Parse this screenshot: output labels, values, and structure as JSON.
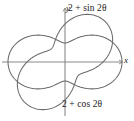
{
  "figure": {
    "type": "polar-curve-plot",
    "background_color": "#ffffff",
    "curve_color": "#6b6b6b",
    "axis_color": "#8a8a8a",
    "text_color": "#1a1a1a",
    "axes": {
      "x_axis_label": "x",
      "y_axis_label": "y",
      "origin_px": [
        65,
        62
      ]
    },
    "labels": {
      "sin_curve": "2 + sin 2θ",
      "cos_curve": "2 + cos 2θ"
    }
  },
  "chart_data": {
    "type": "line",
    "subtype": "polar",
    "title": "",
    "xlabel": "x",
    "ylabel": "y",
    "grid": false,
    "legend_position": "annotations-on-plot",
    "xlim": [
      -3.2,
      3.2
    ],
    "ylim": [
      -3.2,
      3.2
    ],
    "annotations": [
      {
        "text": "2 + sin 2θ",
        "target_series": "r = 2 + sin 2θ",
        "position_px": [
          68,
          4
        ]
      },
      {
        "text": "2 + cos 2θ",
        "target_series": "r = 2 + cos 2θ",
        "position_px": [
          62,
          100
        ]
      }
    ],
    "series": [
      {
        "name": "r = 2 + sin 2θ",
        "equation": "r = 2 + sin(2θ)",
        "r_min": 1,
        "r_max": 3,
        "petal_directions_deg": [
          45,
          135,
          225,
          315
        ],
        "values": [
          {
            "theta_deg": 0,
            "r": 2.0
          },
          {
            "theta_deg": 15,
            "r": 2.5
          },
          {
            "theta_deg": 30,
            "r": 2.866
          },
          {
            "theta_deg": 45,
            "r": 3.0
          },
          {
            "theta_deg": 60,
            "r": 2.866
          },
          {
            "theta_deg": 75,
            "r": 2.5
          },
          {
            "theta_deg": 90,
            "r": 2.0
          },
          {
            "theta_deg": 105,
            "r": 1.5
          },
          {
            "theta_deg": 120,
            "r": 1.134
          },
          {
            "theta_deg": 135,
            "r": 1.0
          },
          {
            "theta_deg": 150,
            "r": 1.134
          },
          {
            "theta_deg": 165,
            "r": 1.5
          },
          {
            "theta_deg": 180,
            "r": 2.0
          },
          {
            "theta_deg": 195,
            "r": 2.5
          },
          {
            "theta_deg": 210,
            "r": 2.866
          },
          {
            "theta_deg": 225,
            "r": 3.0
          },
          {
            "theta_deg": 240,
            "r": 2.866
          },
          {
            "theta_deg": 255,
            "r": 2.5
          },
          {
            "theta_deg": 270,
            "r": 2.0
          },
          {
            "theta_deg": 285,
            "r": 1.5
          },
          {
            "theta_deg": 300,
            "r": 1.134
          },
          {
            "theta_deg": 315,
            "r": 1.0
          },
          {
            "theta_deg": 330,
            "r": 1.134
          },
          {
            "theta_deg": 345,
            "r": 1.5
          },
          {
            "theta_deg": 360,
            "r": 2.0
          }
        ]
      },
      {
        "name": "r = 2 + cos 2θ",
        "equation": "r = 2 + cos(2θ)",
        "r_min": 1,
        "r_max": 3,
        "petal_directions_deg": [
          0,
          90,
          180,
          270
        ],
        "values": [
          {
            "theta_deg": 0,
            "r": 3.0
          },
          {
            "theta_deg": 15,
            "r": 2.866
          },
          {
            "theta_deg": 30,
            "r": 2.5
          },
          {
            "theta_deg": 45,
            "r": 2.0
          },
          {
            "theta_deg": 60,
            "r": 1.5
          },
          {
            "theta_deg": 75,
            "r": 1.134
          },
          {
            "theta_deg": 90,
            "r": 1.0
          },
          {
            "theta_deg": 105,
            "r": 1.134
          },
          {
            "theta_deg": 120,
            "r": 1.5
          },
          {
            "theta_deg": 135,
            "r": 2.0
          },
          {
            "theta_deg": 150,
            "r": 2.5
          },
          {
            "theta_deg": 165,
            "r": 2.866
          },
          {
            "theta_deg": 180,
            "r": 3.0
          },
          {
            "theta_deg": 195,
            "r": 2.866
          },
          {
            "theta_deg": 210,
            "r": 2.5
          },
          {
            "theta_deg": 225,
            "r": 2.0
          },
          {
            "theta_deg": 240,
            "r": 1.5
          },
          {
            "theta_deg": 255,
            "r": 1.134
          },
          {
            "theta_deg": 270,
            "r": 1.0
          },
          {
            "theta_deg": 285,
            "r": 1.134
          },
          {
            "theta_deg": 300,
            "r": 1.5
          },
          {
            "theta_deg": 315,
            "r": 2.0
          },
          {
            "theta_deg": 330,
            "r": 2.5
          },
          {
            "theta_deg": 345,
            "r": 2.866
          },
          {
            "theta_deg": 360,
            "r": 3.0
          }
        ]
      }
    ]
  }
}
